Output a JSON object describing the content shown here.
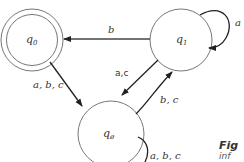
{
  "diagram": {
    "type": "finite-automaton",
    "states": [
      {
        "id": "q0",
        "label": "q",
        "sub": "0",
        "accepting": true
      },
      {
        "id": "q1",
        "label": "q",
        "sub": "1",
        "accepting": false
      },
      {
        "id": "qempty",
        "label": "q",
        "sub": "ø",
        "accepting": false
      }
    ],
    "transitions": [
      {
        "from": "q1",
        "to": "q0",
        "label": "b"
      },
      {
        "from": "q1",
        "to": "q1",
        "label": "a"
      },
      {
        "from": "q0",
        "to": "qempty",
        "label": "a, b, c"
      },
      {
        "from": "q1",
        "to": "qempty",
        "label": "a,c"
      },
      {
        "from": "qempty",
        "to": "q1",
        "label": "b, c"
      },
      {
        "from": "qempty",
        "to": "qempty",
        "label": "a, b, c"
      }
    ]
  },
  "caption": {
    "title": "Fig",
    "subtitle": "inf"
  }
}
